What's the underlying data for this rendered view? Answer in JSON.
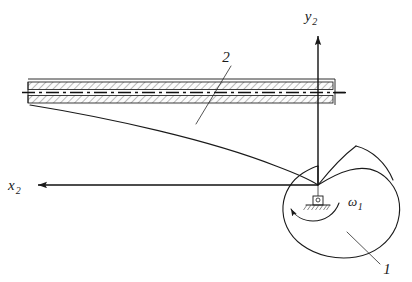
{
  "figure": {
    "type": "engineering-schematic",
    "width": 412,
    "height": 282,
    "background_color": "#ffffff",
    "line_color": "#1a1a1a"
  },
  "axes": {
    "origin": {
      "x": 318,
      "y": 185,
      "name": "pivot-origin"
    },
    "y_axis": {
      "label": "y",
      "subscript": "2",
      "direction": "up",
      "tip": {
        "x": 320,
        "y": 32
      },
      "label_pos": {
        "x": 313,
        "y": 20
      }
    },
    "x_axis": {
      "label": "x",
      "subscript": "2",
      "direction": "left",
      "tip": {
        "x": 32,
        "y": 185
      },
      "label_pos": {
        "x": 10,
        "y": 190
      }
    }
  },
  "parts": [
    {
      "id": "1",
      "label": "1",
      "name": "spiral-cam",
      "description": "Archimedean spiral cam profile rotating about the pivot",
      "label_pos": {
        "x": 384,
        "y": 272
      },
      "leader_from": {
        "x": 380,
        "y": 265
      },
      "leader_to": {
        "x": 347,
        "y": 233
      }
    },
    {
      "id": "2",
      "label": "2",
      "name": "hatched-beam",
      "description": "Hatched elastic beam / follower in contact with the cam",
      "label_pos": {
        "x": 226,
        "y": 60
      },
      "leader_from": {
        "x": 231,
        "y": 66
      },
      "leader_to": {
        "x": 196,
        "y": 124
      }
    }
  ],
  "angular_velocity": {
    "label": "ω",
    "subscript": "1",
    "name": "omega-1",
    "label_pos": {
      "x": 350,
      "y": 206
    },
    "arc_direction": "counterclockwise"
  },
  "support": {
    "name": "pinned-support",
    "type": "pin-joint-with-ground-hatch",
    "pos": {
      "x": 318,
      "y": 202
    }
  },
  "beam": {
    "x_left": 28,
    "x_right": 333,
    "y_top": 82,
    "y_bottom": 103,
    "centerline_y": 92.5,
    "hatch_style": "45-degree-diagonal"
  },
  "deflection_curve": {
    "name": "beam-deflection-curve",
    "from": {
      "x": 30,
      "y": 105
    },
    "to": {
      "x": 318,
      "y": 185
    }
  }
}
